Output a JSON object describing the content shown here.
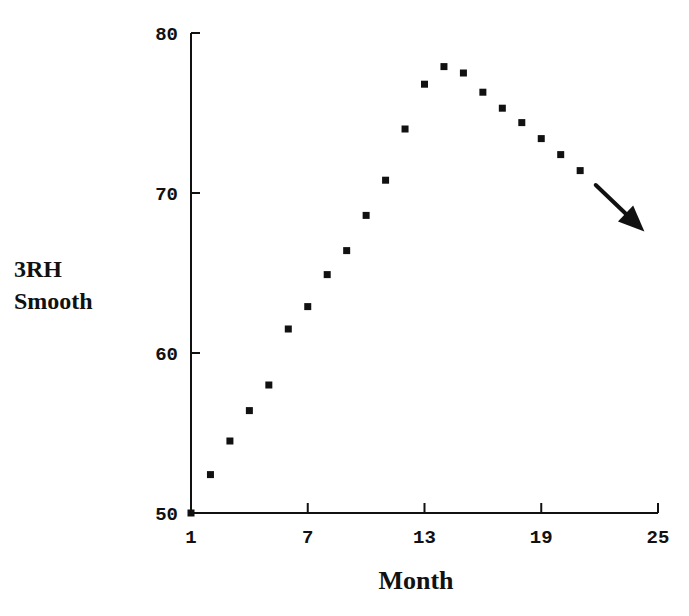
{
  "chart_data": {
    "type": "scatter",
    "title": "",
    "xlabel": "Month",
    "ylabel_lines": [
      "3RH",
      "Smooth"
    ],
    "ylabel": "3RH Smooth",
    "xlim": [
      1,
      25
    ],
    "ylim": [
      50,
      80
    ],
    "x_ticks": [
      1,
      7,
      13,
      19,
      25
    ],
    "y_ticks": [
      50,
      60,
      70,
      80
    ],
    "grid": false,
    "legend": null,
    "marker": "square",
    "marker_color": "#111111",
    "series": [
      {
        "name": "3RH Smooth",
        "x": [
          1,
          2,
          3,
          4,
          5,
          6,
          7,
          8,
          9,
          10,
          11,
          12,
          13,
          14,
          15,
          16,
          17,
          18,
          19,
          20,
          21
        ],
        "values": [
          50.0,
          52.4,
          54.5,
          56.4,
          58.0,
          61.5,
          62.9,
          64.9,
          66.4,
          68.6,
          70.8,
          74.0,
          76.8,
          77.9,
          77.5,
          76.3,
          75.3,
          74.4,
          73.4,
          72.4,
          71.4
        ]
      }
    ],
    "annotations": [
      {
        "type": "arrow",
        "direction": "down-right",
        "from": [
          21.8,
          70.5
        ],
        "to": [
          24.3,
          67.6
        ],
        "meaning": "continuing downward trend"
      }
    ]
  }
}
